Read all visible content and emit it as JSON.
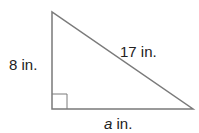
{
  "diagram": {
    "type": "right-triangle",
    "labels": {
      "vertical_leg": "8 in.",
      "hypotenuse": "17 in.",
      "base_var": "a",
      "base_unit": " in."
    },
    "colors": {
      "stroke": "#7a7a7a",
      "text": "#222222"
    }
  }
}
